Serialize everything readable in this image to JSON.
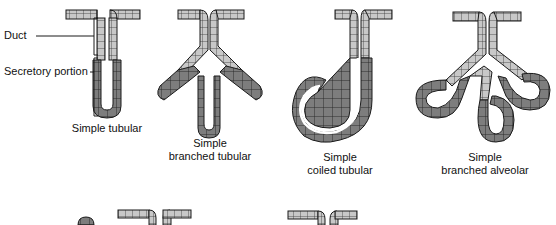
{
  "figure": {
    "annotations": {
      "duct": "Duct",
      "secretory_portion": "Secretory portion"
    },
    "glands": [
      {
        "id": "simple-tubular",
        "line1": "Simple tubular",
        "line2": ""
      },
      {
        "id": "simple-branched-tubular",
        "line1": "Simple",
        "line2": "branched tubular"
      },
      {
        "id": "simple-coiled-tubular",
        "line1": "Simple",
        "line2": "coiled tubular"
      },
      {
        "id": "simple-branched-alveolar",
        "line1": "Simple",
        "line2": "branched alveolar"
      }
    ],
    "colors": {
      "duct_cell": "#c8c8c8",
      "secretory_cell": "#7d7d7d",
      "outline": "#1a1a1a",
      "lumen": "#ffffff"
    }
  }
}
